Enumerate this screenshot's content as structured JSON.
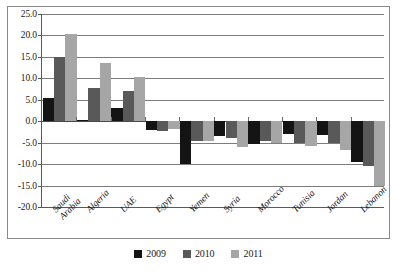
{
  "chart_data": {
    "type": "bar",
    "title": "",
    "subtitle": "",
    "xlabel": "",
    "ylabel": "",
    "ylim": [
      -20.0,
      25.0
    ],
    "ytick_step": 5.0,
    "ytick_labels": [
      "25.0",
      "20.0",
      "15.0",
      "10.0",
      "5.0",
      "0.0",
      "-5.0",
      "-10.0",
      "-15.0",
      "-20.0"
    ],
    "ytick_values": [
      25.0,
      20.0,
      15.0,
      10.0,
      5.0,
      0.0,
      -5.0,
      -10.0,
      -15.0,
      -20.0
    ],
    "grid": true,
    "grid_axis": "y",
    "legend_position": "bottom",
    "categories": [
      "Saudi\nArabia",
      "Algeria",
      "UAE",
      "Egypt",
      "Yemen",
      "Syria",
      "Morocco",
      "Tunisia",
      "Jordan",
      "Lebanon"
    ],
    "series": [
      {
        "name": "2009",
        "color": "#141414",
        "values": [
          5.5,
          0.3,
          3.0,
          -2.0,
          -10.0,
          -3.5,
          -5.3,
          -3.0,
          -3.3,
          -9.5
        ]
      },
      {
        "name": "2010",
        "color": "#595959",
        "values": [
          15.0,
          7.8,
          7.0,
          -2.2,
          -4.5,
          -4.0,
          -4.5,
          -5.0,
          -5.0,
          -10.5
        ]
      },
      {
        "name": "2011",
        "color": "#a6a6a6",
        "values": [
          20.3,
          13.5,
          10.2,
          -1.8,
          -4.5,
          -6.0,
          -5.0,
          -5.7,
          -6.6,
          -15.0
        ]
      }
    ]
  },
  "colors": {
    "series_2009": "#141414",
    "series_2010": "#595959",
    "series_2011": "#a6a6a6",
    "gridline": "#7c7c7c",
    "axis": "#5a5a5a",
    "frame_border": "#8a8a8a",
    "text": "#1a1a1a",
    "background": "#ffffff"
  }
}
